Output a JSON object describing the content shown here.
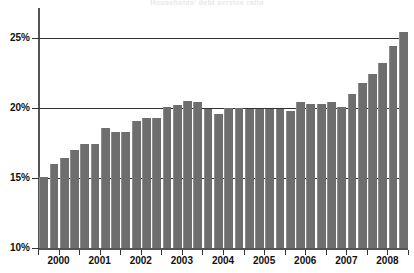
{
  "chart_data": {
    "type": "bar",
    "title": "Households' debt service ratio",
    "xlabel": "",
    "ylabel": "",
    "ylim": [
      10,
      26
    ],
    "yticks": [
      10,
      15,
      20,
      25
    ],
    "ytick_labels": [
      "10%",
      "15%",
      "20%",
      "25%"
    ],
    "grid": true,
    "legend": "none",
    "x_group_labels": [
      "2000",
      "2001",
      "2002",
      "2003",
      "2004",
      "2005",
      "2006",
      "2007",
      "2008"
    ],
    "categories": [
      "2000 Q1",
      "2000 Q2",
      "2000 Q3",
      "2000 Q4",
      "2001 Q1",
      "2001 Q2",
      "2001 Q3",
      "2001 Q4",
      "2002 Q1",
      "2002 Q2",
      "2002 Q3",
      "2002 Q4",
      "2003 Q1",
      "2003 Q2",
      "2003 Q3",
      "2003 Q4",
      "2004 Q1",
      "2004 Q2",
      "2004 Q3",
      "2004 Q4",
      "2005 Q1",
      "2005 Q2",
      "2005 Q3",
      "2005 Q4",
      "2006 Q1",
      "2006 Q2",
      "2006 Q3",
      "2006 Q4",
      "2007 Q1",
      "2007 Q2",
      "2007 Q3",
      "2007 Q4",
      "2008 Q1",
      "2008 Q2",
      "2008 Q3",
      "2008 Q4"
    ],
    "values": [
      15.1,
      16.0,
      16.4,
      17.0,
      17.4,
      17.4,
      18.6,
      18.3,
      18.3,
      19.1,
      19.3,
      19.3,
      20.1,
      20.2,
      20.5,
      20.4,
      19.9,
      19.6,
      20.0,
      20.0,
      19.9,
      19.9,
      19.9,
      19.9,
      19.8,
      20.4,
      20.3,
      20.3,
      20.4,
      20.1,
      21.0,
      21.8,
      22.4,
      23.2,
      24.4,
      25.4
    ],
    "series_color": "#6e6e6e"
  },
  "axis": {
    "y_labels": [
      "25%",
      "20%",
      "15%",
      "10%"
    ],
    "x_labels": [
      "2000",
      "2001",
      "2002",
      "2003",
      "2004",
      "2005",
      "2006",
      "2007",
      "2008"
    ]
  }
}
